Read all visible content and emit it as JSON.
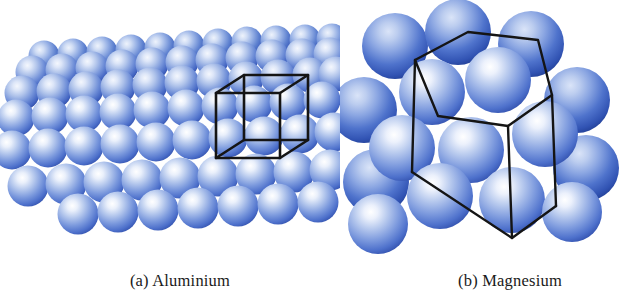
{
  "figure": {
    "background": "#ffffff",
    "width": 635,
    "height": 304
  },
  "panels": [
    {
      "id": "a",
      "caption": "(a) Aluminium",
      "element": "Aluminium",
      "structure_name": "face-centred cubic close packing",
      "unit_cell": "cube",
      "description": "Oblique view of a close-packed slab of spheres with a cubic unit-cell wireframe outlined at the right of the slab."
    },
    {
      "id": "b",
      "caption": "(b) Magnesium",
      "element": "Magnesium",
      "structure_name": "hexagonal close packing",
      "unit_cell": "hexagonal prism",
      "description": "Cluster of spheres with a hexagonal prism unit-cell wireframe drawn through them."
    }
  ],
  "colors": {
    "sphere_highlight": "#ffffff",
    "sphere_light": "#b9cbee",
    "sphere_mid": "#6f8fd8",
    "sphere_deep": "#3f62c4",
    "sphere_rim": "#2c49a8",
    "sphere_back_deep": "#3251b8",
    "wireframe": "#151515",
    "caption_text": "#1a1a1a",
    "background": "#ffffff"
  },
  "wireframe": {
    "stroke_color": "#151515",
    "cube_stroke_width": 2.6,
    "prism_stroke_width": 2.4
  },
  "labels": {
    "panel_a_icon": "sphere-cluster-cubic",
    "panel_b_icon": "sphere-cluster-hexagonal"
  }
}
